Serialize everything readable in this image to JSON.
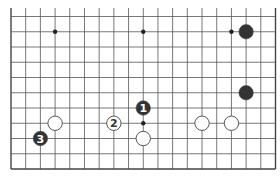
{
  "diagram": {
    "type": "go-board-partial",
    "board_size": 19,
    "visible_rows": 11,
    "visible_edges": [
      "left",
      "right",
      "bottom"
    ],
    "colors": {
      "background": "#ffffff",
      "line": "#555555",
      "edge": "#444444",
      "black_stone": "#333333",
      "white_stone": "#ffffff",
      "stone_outline": "#444444"
    },
    "hoshi": [
      {
        "col": 3,
        "row": 9
      },
      {
        "col": 9,
        "row": 9
      },
      {
        "col": 15,
        "row": 9
      },
      {
        "col": 9,
        "row": 3
      }
    ],
    "stones": [
      {
        "color": "black",
        "col": 16,
        "row": 9,
        "label": ""
      },
      {
        "color": "black",
        "col": 16,
        "row": 5,
        "label": ""
      },
      {
        "color": "black",
        "col": 9,
        "row": 4,
        "label": "1"
      },
      {
        "color": "white",
        "col": 7,
        "row": 3,
        "label": "2"
      },
      {
        "color": "black",
        "col": 2,
        "row": 2,
        "label": "3"
      },
      {
        "color": "white",
        "col": 3,
        "row": 3,
        "label": ""
      },
      {
        "color": "white",
        "col": 9,
        "row": 2,
        "label": ""
      },
      {
        "color": "white",
        "col": 13,
        "row": 3,
        "label": ""
      },
      {
        "color": "white",
        "col": 15,
        "row": 3,
        "label": ""
      }
    ]
  }
}
